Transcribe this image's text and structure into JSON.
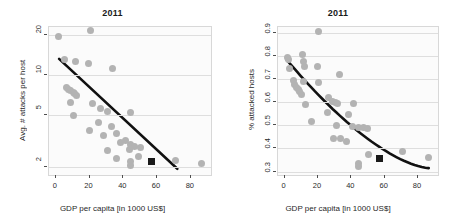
{
  "figure": {
    "width": 451,
    "height": 221,
    "background": "#ffffff",
    "point_color": "#b3b3b3",
    "highlight_color": "#1a1a1a",
    "trend_color": "#111111",
    "grid_color": "#dedede"
  },
  "chart_data": [
    {
      "type": "scatter",
      "title": "2011",
      "xlabel": "GDP per capita [in 1000 US$]",
      "ylabel": "Avg. # attacks per host",
      "xlim": [
        -4,
        92
      ],
      "ylim": [
        1.75,
        23
      ],
      "yscale": "log",
      "xscale": "linear",
      "xticks": [
        0,
        20,
        40,
        60,
        80
      ],
      "yticks": [
        2,
        5,
        10,
        20
      ],
      "grid": "horizontal",
      "legend": "none",
      "points": [
        {
          "x": 1.8,
          "y": 19.5
        },
        {
          "x": 20.5,
          "y": 21.5
        },
        {
          "x": 5.0,
          "y": 13.0
        },
        {
          "x": 11.5,
          "y": 12.6
        },
        {
          "x": 19.5,
          "y": 12.2
        },
        {
          "x": 33.5,
          "y": 11.2
        },
        {
          "x": 6.5,
          "y": 8.0
        },
        {
          "x": 7.8,
          "y": 7.8
        },
        {
          "x": 9.0,
          "y": 7.6
        },
        {
          "x": 10.2,
          "y": 7.4
        },
        {
          "x": 11.0,
          "y": 7.2
        },
        {
          "x": 12.0,
          "y": 7.0
        },
        {
          "x": 8.5,
          "y": 6.2
        },
        {
          "x": 10.5,
          "y": 4.9
        },
        {
          "x": 21.5,
          "y": 6.1
        },
        {
          "x": 26.5,
          "y": 5.6
        },
        {
          "x": 30.5,
          "y": 5.3
        },
        {
          "x": 44.5,
          "y": 5.2
        },
        {
          "x": 20.0,
          "y": 3.8
        },
        {
          "x": 25.5,
          "y": 4.4
        },
        {
          "x": 28.5,
          "y": 3.5
        },
        {
          "x": 33.0,
          "y": 4.1
        },
        {
          "x": 36.0,
          "y": 3.6
        },
        {
          "x": 41.5,
          "y": 3.2
        },
        {
          "x": 44.0,
          "y": 3.0
        },
        {
          "x": 30.5,
          "y": 2.7
        },
        {
          "x": 38.5,
          "y": 3.1
        },
        {
          "x": 43.5,
          "y": 2.75
        },
        {
          "x": 46.5,
          "y": 2.9
        },
        {
          "x": 50.0,
          "y": 2.85
        },
        {
          "x": 36.0,
          "y": 2.35
        },
        {
          "x": 44.0,
          "y": 2.2
        },
        {
          "x": 44.5,
          "y": 2.05
        },
        {
          "x": 49.0,
          "y": 2.4
        },
        {
          "x": 71.0,
          "y": 2.25
        },
        {
          "x": 86.5,
          "y": 2.15
        }
      ],
      "highlight_point": {
        "x": 57.0,
        "y": 2.2,
        "marker": "square",
        "color": "#1a1a1a"
      },
      "trendline": {
        "type": "log-linear",
        "x_start": 2.0,
        "y_start": 13.2,
        "x_end": 72.0,
        "y_end": 1.95
      }
    },
    {
      "type": "scatter",
      "title": "2011",
      "xlabel": "GDP per capita [in 1000 US$]",
      "ylabel": "% attacked hosts",
      "xlim": [
        -4,
        92
      ],
      "ylim": [
        0.285,
        0.925
      ],
      "yscale": "linear",
      "xscale": "linear",
      "xticks": [
        0,
        20,
        40,
        60,
        80
      ],
      "yticks": [
        0.3,
        0.4,
        0.5,
        0.6,
        0.7,
        0.8,
        0.9
      ],
      "grid": "horizontal",
      "legend": "none",
      "points": [
        {
          "x": 20.5,
          "y": 0.905
        },
        {
          "x": 1.5,
          "y": 0.795
        },
        {
          "x": 2.5,
          "y": 0.785
        },
        {
          "x": 10.5,
          "y": 0.805
        },
        {
          "x": 11.5,
          "y": 0.775
        },
        {
          "x": 12.0,
          "y": 0.755
        },
        {
          "x": 19.5,
          "y": 0.755
        },
        {
          "x": 3.0,
          "y": 0.745
        },
        {
          "x": 33.0,
          "y": 0.72
        },
        {
          "x": 5.0,
          "y": 0.695
        },
        {
          "x": 6.0,
          "y": 0.675
        },
        {
          "x": 7.0,
          "y": 0.665
        },
        {
          "x": 8.0,
          "y": 0.655
        },
        {
          "x": 9.0,
          "y": 0.645
        },
        {
          "x": 10.0,
          "y": 0.635
        },
        {
          "x": 11.0,
          "y": 0.69
        },
        {
          "x": 20.0,
          "y": 0.685
        },
        {
          "x": 26.0,
          "y": 0.62
        },
        {
          "x": 28.5,
          "y": 0.605
        },
        {
          "x": 30.5,
          "y": 0.6
        },
        {
          "x": 31.5,
          "y": 0.595
        },
        {
          "x": 41.5,
          "y": 0.595
        },
        {
          "x": 12.5,
          "y": 0.59
        },
        {
          "x": 25.5,
          "y": 0.555
        },
        {
          "x": 38.5,
          "y": 0.545
        },
        {
          "x": 16.0,
          "y": 0.515
        },
        {
          "x": 31.0,
          "y": 0.5
        },
        {
          "x": 40.5,
          "y": 0.495
        },
        {
          "x": 44.5,
          "y": 0.49
        },
        {
          "x": 47.0,
          "y": 0.49
        },
        {
          "x": 49.5,
          "y": 0.485
        },
        {
          "x": 29.5,
          "y": 0.445
        },
        {
          "x": 33.5,
          "y": 0.445
        },
        {
          "x": 37.0,
          "y": 0.43
        },
        {
          "x": 70.5,
          "y": 0.385
        },
        {
          "x": 50.0,
          "y": 0.375
        },
        {
          "x": 86.5,
          "y": 0.36
        },
        {
          "x": 44.0,
          "y": 0.335
        },
        {
          "x": 44.5,
          "y": 0.32
        }
      ],
      "highlight_point": {
        "x": 57.0,
        "y": 0.355,
        "marker": "square",
        "color": "#1a1a1a"
      },
      "trendline": {
        "type": "log-decay",
        "x_start": 1.0,
        "y_start": 0.785,
        "x_end": 86.5,
        "y_end": 0.315
      }
    }
  ]
}
